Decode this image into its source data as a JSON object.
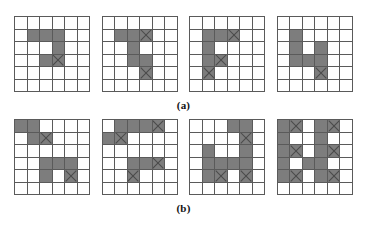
{
  "figure": {
    "cell_fill_color": "#7d7d7d",
    "cell_empty_color": "#ffffff",
    "grid_line_color": "#5a5a5a",
    "marker_color": "#4a4a4a",
    "grid_rows": 6,
    "grid_cols": 6,
    "marker_glyph": "x-cross-marker"
  },
  "rows": [
    {
      "label": "(a)",
      "grids": [
        {
          "name": "grid-a-1",
          "cells": [
            [
              0,
              0,
              0,
              0,
              0,
              0
            ],
            [
              0,
              1,
              1,
              1,
              0,
              0
            ],
            [
              0,
              0,
              0,
              1,
              0,
              0
            ],
            [
              0,
              0,
              1,
              2,
              0,
              0
            ],
            [
              0,
              0,
              0,
              0,
              0,
              0
            ],
            [
              0,
              0,
              0,
              0,
              0,
              0
            ]
          ]
        },
        {
          "name": "grid-a-2",
          "cells": [
            [
              0,
              0,
              0,
              0,
              0,
              0
            ],
            [
              0,
              1,
              1,
              2,
              0,
              0
            ],
            [
              0,
              0,
              1,
              0,
              0,
              0
            ],
            [
              0,
              0,
              1,
              1,
              0,
              0
            ],
            [
              0,
              0,
              0,
              2,
              0,
              0
            ],
            [
              0,
              0,
              0,
              0,
              0,
              0
            ]
          ]
        },
        {
          "name": "grid-a-3",
          "cells": [
            [
              0,
              0,
              0,
              0,
              0,
              0
            ],
            [
              0,
              1,
              1,
              2,
              0,
              0
            ],
            [
              0,
              1,
              0,
              0,
              0,
              0
            ],
            [
              0,
              1,
              2,
              0,
              0,
              0
            ],
            [
              0,
              2,
              0,
              0,
              0,
              0
            ],
            [
              0,
              0,
              0,
              0,
              0,
              0
            ]
          ]
        },
        {
          "name": "grid-a-4",
          "cells": [
            [
              0,
              0,
              0,
              0,
              0,
              0
            ],
            [
              0,
              1,
              0,
              0,
              0,
              0
            ],
            [
              0,
              1,
              0,
              1,
              0,
              0
            ],
            [
              0,
              1,
              1,
              1,
              0,
              0
            ],
            [
              0,
              0,
              0,
              2,
              0,
              0
            ],
            [
              0,
              0,
              0,
              0,
              0,
              0
            ]
          ]
        }
      ]
    },
    {
      "label": "(b)",
      "grids": [
        {
          "name": "grid-b-1",
          "cells": [
            [
              1,
              1,
              0,
              0,
              0,
              0
            ],
            [
              0,
              1,
              2,
              0,
              0,
              0
            ],
            [
              0,
              0,
              0,
              0,
              0,
              0
            ],
            [
              0,
              0,
              1,
              1,
              1,
              0
            ],
            [
              0,
              0,
              1,
              0,
              2,
              0
            ],
            [
              0,
              0,
              0,
              0,
              0,
              0
            ]
          ]
        },
        {
          "name": "grid-b-2",
          "cells": [
            [
              0,
              1,
              1,
              1,
              2,
              0
            ],
            [
              1,
              2,
              0,
              0,
              0,
              0
            ],
            [
              0,
              0,
              0,
              0,
              0,
              0
            ],
            [
              0,
              0,
              1,
              1,
              2,
              0
            ],
            [
              0,
              0,
              2,
              0,
              0,
              0
            ],
            [
              0,
              0,
              0,
              0,
              0,
              0
            ]
          ]
        },
        {
          "name": "grid-b-3",
          "cells": [
            [
              0,
              0,
              0,
              1,
              1,
              0
            ],
            [
              0,
              0,
              0,
              0,
              2,
              0
            ],
            [
              0,
              1,
              0,
              0,
              1,
              0
            ],
            [
              0,
              1,
              1,
              1,
              1,
              0
            ],
            [
              0,
              1,
              2,
              0,
              2,
              0
            ],
            [
              0,
              0,
              0,
              0,
              0,
              0
            ]
          ]
        },
        {
          "name": "grid-b-4",
          "cells": [
            [
              1,
              2,
              0,
              1,
              2,
              0
            ],
            [
              1,
              0,
              0,
              1,
              0,
              0
            ],
            [
              1,
              2,
              0,
              1,
              2,
              0
            ],
            [
              1,
              0,
              1,
              1,
              0,
              0
            ],
            [
              1,
              2,
              0,
              1,
              2,
              0
            ],
            [
              0,
              0,
              0,
              0,
              0,
              0
            ]
          ]
        }
      ]
    }
  ]
}
